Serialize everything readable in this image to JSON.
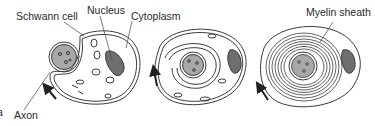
{
  "diagram": {
    "panel_marker": "a",
    "labels": {
      "schwann_cell": "Schwann cell",
      "nucleus": "Nucleus",
      "cytoplasm": "Cytoplasm",
      "axon": "Axon",
      "myelin_sheath": "Myelin sheath"
    },
    "stages": [
      {
        "id": "stage-1",
        "description": "Schwann cell begins to wrap around axon"
      },
      {
        "id": "stage-2",
        "description": "Schwann cell wraps several layers around axon"
      },
      {
        "id": "stage-3",
        "description": "Many layers form the myelin sheath"
      }
    ],
    "colors": {
      "outline": "#3a3a3a",
      "nucleus_fill": "#6e6e6e",
      "axon_fill": "#a8a8a8",
      "background": "#ffffff"
    }
  }
}
